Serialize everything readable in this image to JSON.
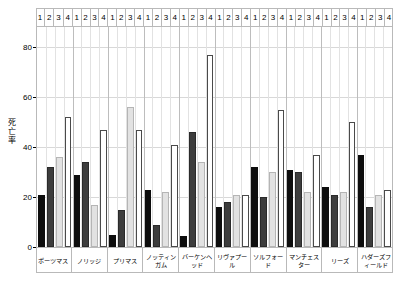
{
  "chart_data": {
    "type": "bar",
    "title": "",
    "xlabel": "",
    "ylabel": "死亡率",
    "ylim": [
      0,
      88
    ],
    "yticks": [
      0,
      20,
      40,
      60,
      80
    ],
    "grid": true,
    "legend_position": "none",
    "sub_labels": [
      "1",
      "2",
      "3",
      "4"
    ],
    "categories": [
      "ポーツマス",
      "ノリッジ",
      "プリマス",
      "ノッティンガム",
      "バーケンヘッド",
      "リヴァプール",
      "ソルフォード",
      "マンチェスター",
      "リーズ",
      "ハダーズフィールド"
    ],
    "series": [
      {
        "name": "1",
        "color": "#0d0d0d",
        "values": [
          21,
          29,
          5,
          23,
          4.5,
          16,
          32,
          31,
          24,
          37
        ]
      },
      {
        "name": "2",
        "color": "#3d3d3d",
        "values": [
          32,
          34,
          15,
          9,
          46,
          18,
          20,
          30,
          21,
          16
        ]
      },
      {
        "name": "3",
        "color": "#e2e2e2",
        "values": [
          36,
          17,
          56,
          22,
          34,
          21,
          30,
          22,
          22,
          21
        ]
      },
      {
        "name": "4",
        "color": "#ffffff",
        "values": [
          52,
          47,
          47,
          41,
          77,
          21,
          55,
          37,
          50,
          23
        ]
      }
    ]
  },
  "axis": {
    "y_label_chars": [
      "死",
      "亡",
      "率"
    ]
  }
}
